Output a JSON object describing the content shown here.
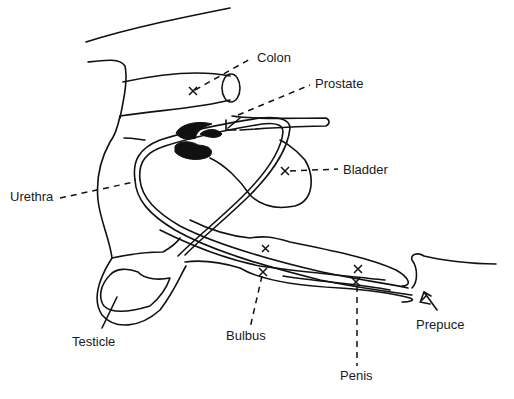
{
  "diagram": {
    "labels": [
      {
        "id": "colon",
        "text": "Colon",
        "x": 257,
        "y": 62
      },
      {
        "id": "prostate",
        "text": "Prostate",
        "x": 315,
        "y": 88
      },
      {
        "id": "bladder",
        "text": "Bladder",
        "x": 343,
        "y": 174
      },
      {
        "id": "urethra",
        "text": "Urethra",
        "x": 10,
        "y": 201
      },
      {
        "id": "testicle",
        "text": "Testicle",
        "x": 72,
        "y": 346
      },
      {
        "id": "bulbus",
        "text": "Bulbus",
        "x": 226,
        "y": 340
      },
      {
        "id": "penis",
        "text": "Penis",
        "x": 340,
        "y": 380
      },
      {
        "id": "prepuce",
        "text": "Prepuce",
        "x": 416,
        "y": 329
      }
    ],
    "markers": [
      {
        "target": "colon",
        "x": 193,
        "y": 91
      },
      {
        "target": "bladder",
        "x": 285,
        "y": 171
      },
      {
        "target": "urethra",
        "x": 136,
        "y": 180
      },
      {
        "target": "corpus",
        "x": 266,
        "y": 249
      },
      {
        "target": "bulbus",
        "x": 263,
        "y": 272
      },
      {
        "target": "penis-upper",
        "x": 358,
        "y": 269
      },
      {
        "target": "penis-lower",
        "x": 356,
        "y": 282
      }
    ]
  }
}
